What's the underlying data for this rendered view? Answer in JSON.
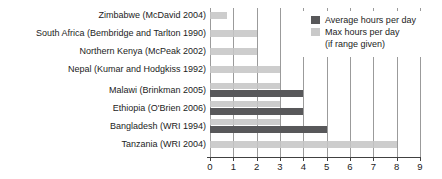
{
  "chart_data": {
    "type": "bar",
    "orientation": "horizontal",
    "title": "",
    "xlabel": "",
    "ylabel": "",
    "xlim": [
      0,
      9
    ],
    "xticks": [
      "0",
      "1",
      "2",
      "3",
      "4",
      "5",
      "6",
      "7",
      "8",
      "9"
    ],
    "grid": true,
    "legend_position": "top-right",
    "legend": {
      "items": [
        {
          "name": "average",
          "label": "Average hours per day",
          "sublabel": "",
          "color": "#58585a"
        },
        {
          "name": "max",
          "label": "Max hours per day",
          "sublabel": "(if range given)",
          "color": "#c9c9c9"
        }
      ]
    },
    "categories": [
      "Zimbabwe (McDavid 2004)",
      "South Africa (Bembridge and Tarlton 1990)",
      "Northern Kenya (McPeak 2002)",
      "Nepal (Kumar and Hodgkiss 1992)",
      "Malawi (Brinkman 2005)",
      "Ethiopia (O'Brien 2006)",
      "Bangladesh (WRI 1994)",
      "Tanzania (WRI 2004)"
    ],
    "series": [
      {
        "name": "Average hours per day",
        "values": [
          null,
          null,
          null,
          null,
          4,
          4,
          5,
          null
        ]
      },
      {
        "name": "Max hours per day (if range given)",
        "values": [
          0.75,
          2,
          2,
          3,
          3,
          3,
          3,
          8
        ]
      }
    ]
  },
  "colors": {
    "average_bar": "#58585a",
    "max_bar": "#c6c6c6",
    "gridline": "#9b9b9b",
    "axis": "#414141",
    "text": "#1c1c1c",
    "background": "#ffffff"
  }
}
